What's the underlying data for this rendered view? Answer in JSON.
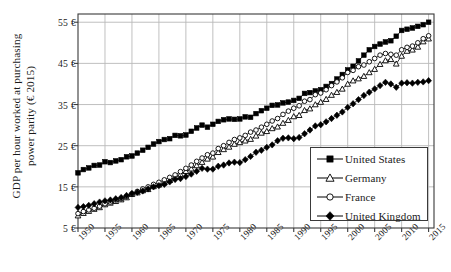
{
  "chart_data": {
    "type": "line",
    "title": "",
    "xlabel": "",
    "ylabel": "GDP per hour worked at purchasing power parity (€ 2015)",
    "ylabel_line1": "GDP per hour worked at purchasing",
    "ylabel_line2": "power parity (€ 2015)",
    "xlim": [
      1950,
      2016
    ],
    "ylim": [
      5,
      57
    ],
    "ytick_values": [
      5,
      15,
      25,
      35,
      45,
      55
    ],
    "ytick_labels": [
      "5 €",
      "15 €",
      "25 €",
      "35 €",
      "45 €",
      "55 €"
    ],
    "xtick_values": [
      1950,
      1955,
      1960,
      1965,
      1970,
      1975,
      1980,
      1985,
      1990,
      1995,
      2000,
      2005,
      2010,
      2015
    ],
    "xtick_labels": [
      "1950",
      "1955",
      "1960",
      "1965",
      "1970",
      "1975",
      "1980",
      "1985",
      "1990",
      "1995",
      "2000",
      "2005",
      "2010",
      "2015"
    ],
    "grid": true,
    "legend_position": "lower-right",
    "x": [
      1950,
      1951,
      1952,
      1953,
      1954,
      1955,
      1956,
      1957,
      1958,
      1959,
      1960,
      1961,
      1962,
      1963,
      1964,
      1965,
      1966,
      1967,
      1968,
      1969,
      1970,
      1971,
      1972,
      1973,
      1974,
      1975,
      1976,
      1977,
      1978,
      1979,
      1980,
      1981,
      1982,
      1983,
      1984,
      1985,
      1986,
      1987,
      1988,
      1989,
      1990,
      1991,
      1992,
      1993,
      1994,
      1995,
      1996,
      1997,
      1998,
      1999,
      2000,
      2001,
      2002,
      2003,
      2004,
      2005,
      2006,
      2007,
      2008,
      2009,
      2010,
      2011,
      2012,
      2013,
      2014,
      2015
    ],
    "series": [
      {
        "name": "United States",
        "marker": "filled-square",
        "color": "#000000",
        "values": [
          18.4,
          19.2,
          19.6,
          20.2,
          20.3,
          21.1,
          20.9,
          21.3,
          21.6,
          22.3,
          22.5,
          23.2,
          23.9,
          24.6,
          25.4,
          26.0,
          26.5,
          26.7,
          27.5,
          27.4,
          27.6,
          28.5,
          29.3,
          30.0,
          29.5,
          30.2,
          30.9,
          31.3,
          31.5,
          31.4,
          31.5,
          32.0,
          31.9,
          32.8,
          33.5,
          34.1,
          34.8,
          34.9,
          35.4,
          35.6,
          36.0,
          36.5,
          37.7,
          37.9,
          38.3,
          38.6,
          39.4,
          40.1,
          41.2,
          42.3,
          43.4,
          44.3,
          45.6,
          47.0,
          48.3,
          49.1,
          49.7,
          50.2,
          50.5,
          51.6,
          53.0,
          53.3,
          53.6,
          54.0,
          54.4,
          55.0
        ]
      },
      {
        "name": "Germany",
        "marker": "open-triangle",
        "color": "#000000",
        "values": [
          8.0,
          8.6,
          9.1,
          9.6,
          10.0,
          10.7,
          11.1,
          11.5,
          11.9,
          12.4,
          13.2,
          13.6,
          14.1,
          14.4,
          15.1,
          15.5,
          16.0,
          16.6,
          17.4,
          18.0,
          18.8,
          19.4,
          20.2,
          21.0,
          21.8,
          22.3,
          23.4,
          24.1,
          24.7,
          25.4,
          25.8,
          26.2,
          26.6,
          27.4,
          28.1,
          28.5,
          29.2,
          29.6,
          30.5,
          31.2,
          32.1,
          32.4,
          33.6,
          34.0,
          35.0,
          35.6,
          36.3,
          37.3,
          38.0,
          38.8,
          40.0,
          40.8,
          41.3,
          41.9,
          42.8,
          43.6,
          44.8,
          45.7,
          46.0,
          44.9,
          46.8,
          48.0,
          48.3,
          49.0,
          50.3,
          51.0
        ]
      },
      {
        "name": "France",
        "marker": "open-circle",
        "color": "#000000",
        "values": [
          8.5,
          9.0,
          9.4,
          9.8,
          10.3,
          10.9,
          11.3,
          11.8,
          12.1,
          12.6,
          13.3,
          13.9,
          14.5,
          15.0,
          15.6,
          16.1,
          16.7,
          17.3,
          17.9,
          18.7,
          19.5,
          20.3,
          21.2,
          22.0,
          22.8,
          23.2,
          24.3,
          25.0,
          25.8,
          26.5,
          26.9,
          27.5,
          28.3,
          28.8,
          29.5,
          30.2,
          31.0,
          31.6,
          32.6,
          33.4,
          34.1,
          34.7,
          35.8,
          36.2,
          37.4,
          37.8,
          38.6,
          39.6,
          40.5,
          41.5,
          42.8,
          43.3,
          44.2,
          44.6,
          45.4,
          46.2,
          47.0,
          47.4,
          47.2,
          47.0,
          48.3,
          48.9,
          49.2,
          50.0,
          51.0,
          51.7
        ]
      },
      {
        "name": "United Kingdom",
        "marker": "filled-diamond",
        "color": "#000000",
        "values": [
          10.0,
          10.2,
          10.5,
          10.9,
          11.3,
          11.6,
          11.8,
          12.1,
          12.4,
          12.9,
          13.4,
          13.7,
          14.0,
          14.5,
          15.0,
          15.3,
          15.6,
          16.2,
          16.8,
          17.0,
          17.5,
          18.1,
          18.8,
          19.5,
          19.3,
          19.3,
          20.0,
          20.3,
          20.8,
          21.0,
          20.9,
          21.6,
          22.4,
          23.4,
          23.9,
          24.6,
          25.2,
          26.2,
          26.8,
          26.9,
          26.7,
          27.0,
          27.9,
          28.8,
          29.8,
          30.1,
          30.8,
          31.6,
          32.4,
          33.2,
          34.3,
          35.2,
          36.2,
          37.2,
          38.0,
          38.8,
          39.6,
          40.4,
          40.0,
          39.2,
          40.2,
          40.3,
          40.2,
          40.4,
          40.5,
          40.8
        ]
      }
    ]
  },
  "legend": {
    "items": [
      {
        "label": "United States",
        "marker": "filled-square"
      },
      {
        "label": "Germany",
        "marker": "open-triangle"
      },
      {
        "label": "France",
        "marker": "open-circle"
      },
      {
        "label": "United Kingdom",
        "marker": "filled-diamond"
      }
    ]
  },
  "colors": {
    "ink": "#000000",
    "axis": "#3a3a3a",
    "grid": "#b9b9b9",
    "background": "#ffffff"
  }
}
